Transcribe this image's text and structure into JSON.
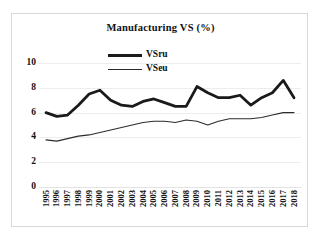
{
  "chart_data": {
    "type": "line",
    "title": "Manufacturing VS (%)",
    "xlabel": "",
    "ylabel": "",
    "ylim": [
      0,
      10
    ],
    "yticks": [
      10,
      8,
      6,
      4,
      2,
      0
    ],
    "grid": true,
    "legend_position": "top-center",
    "categories": [
      "1995",
      "1996",
      "1997",
      "1998",
      "1999",
      "2000",
      "2001",
      "2002",
      "2003",
      "2004",
      "2005",
      "2006",
      "2007",
      "2008",
      "2009",
      "2010",
      "2011",
      "2012",
      "2013",
      "2014",
      "2015",
      "2016",
      "2017",
      "2018"
    ],
    "series": [
      {
        "name": "VSru",
        "style": "thick",
        "color": "#1a1a1a",
        "values": [
          6.0,
          5.7,
          5.8,
          6.6,
          7.5,
          7.8,
          7.0,
          6.6,
          6.5,
          6.9,
          7.1,
          6.8,
          6.5,
          6.5,
          8.1,
          7.6,
          7.2,
          7.2,
          7.4,
          6.6,
          7.2,
          7.6,
          8.6,
          7.2
        ]
      },
      {
        "name": "VSeu",
        "style": "thin",
        "color": "#2b2b2b",
        "values": [
          3.8,
          3.7,
          3.9,
          4.1,
          4.2,
          4.4,
          4.6,
          4.8,
          5.0,
          5.2,
          5.3,
          5.3,
          5.2,
          5.4,
          5.3,
          5.0,
          5.3,
          5.5,
          5.5,
          5.5,
          5.6,
          5.8,
          6.0,
          6.0
        ]
      }
    ]
  },
  "legend": {
    "entries": [
      {
        "label": "VSru"
      },
      {
        "label": "VSeu"
      }
    ]
  }
}
